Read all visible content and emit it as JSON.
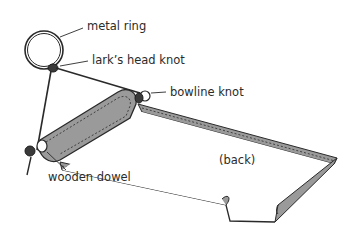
{
  "diagram": {
    "type": "labeled-illustration",
    "colors": {
      "line": "#2a2a2a",
      "fabric_fill": "#9a9a9a",
      "back_fill": "#ffffff",
      "text": "#2b2b2b"
    },
    "labels": [
      {
        "id": "metal-ring",
        "text": "metal ring",
        "x": 87,
        "y": 21
      },
      {
        "id": "larks-head-knot",
        "text": "lark’s head knot",
        "x": 92,
        "y": 55
      },
      {
        "id": "bowline-knot",
        "text": "bowline knot",
        "x": 170,
        "y": 87
      },
      {
        "id": "back",
        "text": "(back)",
        "x": 219,
        "y": 155
      },
      {
        "id": "wooden-dowel",
        "text": "wooden dowel",
        "x": 48,
        "y": 172
      }
    ]
  }
}
